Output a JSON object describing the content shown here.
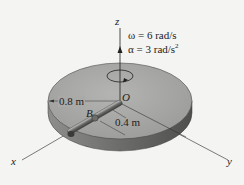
{
  "diagram": {
    "type": "rotating-disk-with-slotted-rod",
    "axes": {
      "x": "x",
      "y": "y",
      "z": "z"
    },
    "origin_label": "O",
    "collar_label": "B",
    "dimensions": {
      "disk_radius": "0.8 m",
      "rod_offset": "0.4 m"
    },
    "kinematics": {
      "omega": "ω = 6 rad/s",
      "alpha_prefix": "α = 3 rad/s",
      "alpha_exponent": "2"
    },
    "colors": {
      "background": "#f4f4f2",
      "disk_top": "#a9a9a7",
      "disk_side": "#7a7a78",
      "rod": "#5a5a58",
      "lines": "#333333"
    }
  }
}
